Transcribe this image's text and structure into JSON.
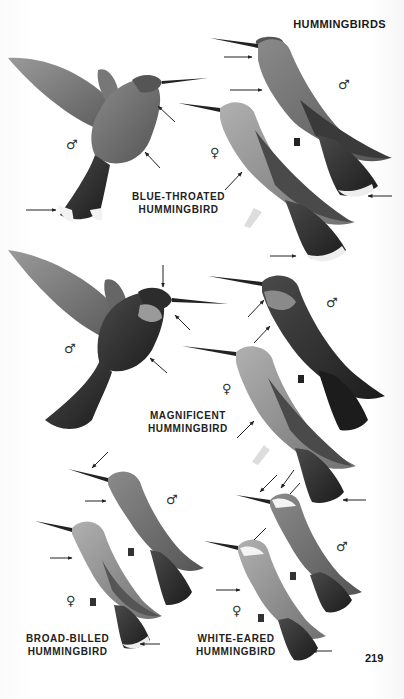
{
  "page": {
    "header": "HUMMINGBIRDS",
    "page_number": "219",
    "background": "#ffffff",
    "ink_color": "#1e1e1e"
  },
  "species": [
    {
      "name_line1": "BLUE-THROATED",
      "name_line2": "HUMMINGBIRD",
      "figures": [
        {
          "sex": "male",
          "symbol": "♂",
          "pose": "hovering"
        },
        {
          "sex": "male",
          "symbol": "♂",
          "pose": "perched"
        },
        {
          "sex": "female",
          "symbol": "♀",
          "pose": "perched"
        }
      ]
    },
    {
      "name_line1": "MAGNIFICENT",
      "name_line2": "HUMMINGBIRD",
      "figures": [
        {
          "sex": "male",
          "symbol": "♂",
          "pose": "hovering"
        },
        {
          "sex": "male",
          "symbol": "♂",
          "pose": "perched"
        },
        {
          "sex": "female",
          "symbol": "♀",
          "pose": "perched"
        }
      ]
    },
    {
      "name_line1": "BROAD-BILLED",
      "name_line2": "HUMMINGBIRD",
      "figures": [
        {
          "sex": "male",
          "symbol": "♂",
          "pose": "perched"
        },
        {
          "sex": "female",
          "symbol": "♀",
          "pose": "perched"
        }
      ]
    },
    {
      "name_line1": "WHITE-EARED",
      "name_line2": "HUMMINGBIRD",
      "figures": [
        {
          "sex": "male",
          "symbol": "♂",
          "pose": "perched"
        },
        {
          "sex": "female",
          "symbol": "♀",
          "pose": "perched"
        }
      ]
    }
  ]
}
